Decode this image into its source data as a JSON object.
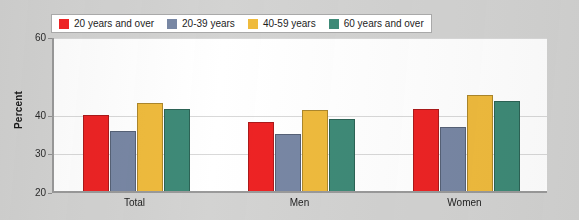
{
  "chart_data": {
    "type": "bar",
    "title": "",
    "xlabel": "",
    "ylabel": "Percent",
    "ylim": [
      20,
      60
    ],
    "grid": true,
    "legend_position": "top-left",
    "ytick_labels": [
      "60",
      "40",
      "30",
      "20"
    ],
    "ytick_values": [
      60,
      40,
      30,
      20
    ],
    "categories": [
      "Total",
      "Men",
      "Women"
    ],
    "series": [
      {
        "name": "20 years and over",
        "color": "#ed2324",
        "values": [
          39.5,
          37.9,
          41.2
        ]
      },
      {
        "name": "20-39 years",
        "color": "#7887a4",
        "values": [
          35.6,
          34.6,
          36.5
        ]
      },
      {
        "name": "40-59 years",
        "color": "#efbb3d",
        "values": [
          42.8,
          40.8,
          44.8
        ]
      },
      {
        "name": "60 years and over",
        "color": "#3e8a77",
        "values": [
          41.2,
          38.5,
          43.2
        ]
      }
    ]
  },
  "legend": {
    "items": [
      {
        "label": "20 years and over",
        "color": "#ed2324"
      },
      {
        "label": "20-39 years",
        "color": "#7887a4"
      },
      {
        "label": "40-59 years",
        "color": "#efbb3d"
      },
      {
        "label": "60 years and over",
        "color": "#3e8a77"
      }
    ]
  },
  "colors": {
    "page_background": "#d3d3d2",
    "plot_background": "#ffffff",
    "axis_line": "#9a9a9a",
    "gridline": "#d9d9d9",
    "text": "#1d1d1d"
  }
}
